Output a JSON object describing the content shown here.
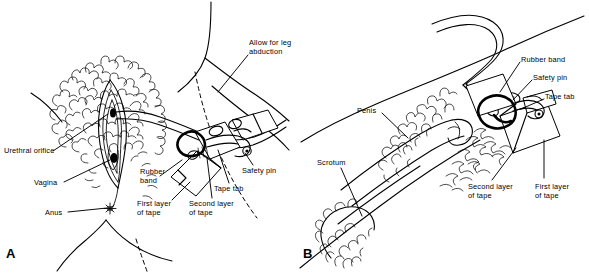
{
  "figure": {
    "type": "line-drawing-medical-illustration",
    "ink_color": "#000000",
    "background_color": "#ffffff",
    "width": 589,
    "height": 274
  },
  "panels": [
    {
      "id": "A",
      "letter": "A",
      "subject": "female perineum",
      "labels": [
        {
          "key": "allow_for_leg_abduction",
          "text": "Allow for leg\nabduction",
          "x": 249,
          "y": 40
        },
        {
          "key": "urethral_orifice",
          "text": "Urethral orifice",
          "x": 5,
          "y": 148
        },
        {
          "key": "vagina",
          "text": "Vagina",
          "x": 35,
          "y": 180
        },
        {
          "key": "anus",
          "text": "Anus",
          "x": 46,
          "y": 210
        },
        {
          "key": "rubber_band",
          "text": "Rubber\nband",
          "x": 141,
          "y": 169
        },
        {
          "key": "first_layer_of_tape",
          "text": "First layer\nof tape",
          "x": 138,
          "y": 201
        },
        {
          "key": "second_layer_of_tape",
          "text": "Second layer\nof tape",
          "x": 190,
          "y": 201
        },
        {
          "key": "tape_tab",
          "text": "Tape tab",
          "x": 215,
          "y": 186
        },
        {
          "key": "safety_pin",
          "text": "Safety pin",
          "x": 243,
          "y": 168
        }
      ]
    },
    {
      "id": "B",
      "letter": "B",
      "subject": "male genitalia",
      "labels": [
        {
          "key": "rubber_band",
          "text": "Rubber band",
          "x": 522,
          "y": 57
        },
        {
          "key": "safety_pin",
          "text": "Safety pin",
          "x": 534,
          "y": 75
        },
        {
          "key": "tape_tab",
          "text": "Tape tab",
          "x": 546,
          "y": 94
        },
        {
          "key": "penis",
          "text": "Penis",
          "x": 358,
          "y": 108
        },
        {
          "key": "scrotum",
          "text": "Scrotum",
          "x": 318,
          "y": 160
        },
        {
          "key": "second_layer_of_tape",
          "text": "Second layer\nof tape",
          "x": 469,
          "y": 184
        },
        {
          "key": "first_layer_of_tape",
          "text": "First layer\nof tape",
          "x": 536,
          "y": 184
        }
      ]
    }
  ],
  "panel_letters": [
    {
      "letter": "A",
      "x": 6,
      "y": 250
    },
    {
      "letter": "B",
      "x": 303,
      "y": 250
    }
  ]
}
